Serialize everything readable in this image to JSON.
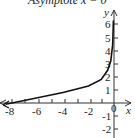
{
  "chart_data": {
    "type": "line",
    "title": "Asymptote x = 0",
    "xlabel": "x",
    "ylabel": "y",
    "xlim": [
      -8.5,
      1.2
    ],
    "ylim": [
      -2.5,
      6.7
    ],
    "x_ticks": [
      "-8",
      "-6",
      "-4",
      "-2",
      "0"
    ],
    "y_ticks": [
      "6",
      "5",
      "4",
      "3",
      "2",
      "1",
      "-1",
      "-2"
    ],
    "grid": false,
    "series": [
      {
        "name": "curve",
        "x": [
          -8.5,
          -8,
          -6,
          -4,
          -2,
          -1,
          -0.5,
          -0.25,
          -0.1,
          -0.05
        ],
        "y": [
          -0.1,
          0,
          0.4,
          0.8,
          1.3,
          1.8,
          2.5,
          3.2,
          4.5,
          6.3
        ]
      }
    ],
    "annotations": [
      "Asymptote x = 0"
    ]
  }
}
